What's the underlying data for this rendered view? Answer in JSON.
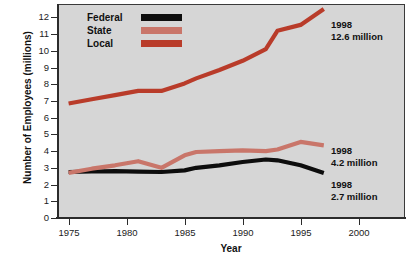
{
  "chart_data": {
    "type": "line",
    "title": "",
    "xlabel": "Year",
    "ylabel": "Number of Employees (millions)",
    "xlim": [
      1974,
      2004
    ],
    "ylim": [
      0,
      12.8
    ],
    "grid": false,
    "legend_position": "top-left",
    "xticks": [
      "1975",
      "1980",
      "1985",
      "1990",
      "1995",
      "2000"
    ],
    "xtick_values": [
      1975,
      1980,
      1985,
      1990,
      1995,
      2000
    ],
    "yticks": [
      "0",
      "1",
      "2",
      "3",
      "4",
      "5",
      "6",
      "7",
      "8",
      "9",
      "10",
      "11",
      "12"
    ],
    "ytick_values": [
      0,
      1,
      2,
      3,
      4,
      5,
      6,
      7,
      8,
      9,
      10,
      11,
      12
    ],
    "x": [
      1975,
      1977,
      1979,
      1981,
      1983,
      1985,
      1986,
      1988,
      1990,
      1992,
      1993,
      1995,
      1997
    ],
    "series": [
      {
        "name": "Federal",
        "color": "#0d0d0d",
        "values": [
          2.75,
          2.78,
          2.8,
          2.77,
          2.75,
          2.85,
          3.0,
          3.15,
          3.35,
          3.5,
          3.45,
          3.15,
          2.7
        ]
      },
      {
        "name": "State",
        "color": "#c9766a",
        "values": [
          2.7,
          2.95,
          3.15,
          3.4,
          3.0,
          3.75,
          3.95,
          4.0,
          4.05,
          4.0,
          4.1,
          4.55,
          4.35
        ]
      },
      {
        "name": "Local",
        "color": "#b93c2a",
        "values": [
          6.85,
          7.1,
          7.35,
          7.6,
          7.6,
          8.05,
          8.35,
          8.85,
          9.4,
          10.1,
          11.2,
          11.55,
          12.5
        ]
      }
    ]
  },
  "legend": {
    "items": [
      {
        "label": "Federal",
        "color": "#0d0d0d"
      },
      {
        "label": "State",
        "color": "#c9766a"
      },
      {
        "label": "Local",
        "color": "#b93c2a"
      }
    ]
  },
  "annotations": [
    {
      "year": "1998",
      "value": "12.6 million",
      "series": "Local"
    },
    {
      "year": "1998",
      "value": "4.2 million",
      "series": "State"
    },
    {
      "year": "1998",
      "value": "2.7 million",
      "series": "Federal"
    }
  ],
  "axes": {
    "x_title": "Year",
    "y_title": "Number of Employees (millions)"
  },
  "colors": {
    "plot_background": "#d6d6d6",
    "page_background": "#ffffff",
    "axis": "#2b2b2b",
    "text": "#111111"
  }
}
